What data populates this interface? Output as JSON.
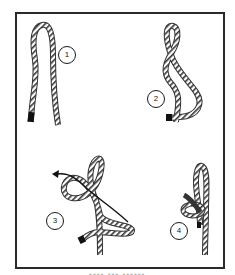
{
  "figure": {
    "caption_visible": false,
    "border_color": "#2a2a2a",
    "rope_color": "#3a3a3a",
    "steps": [
      {
        "number": "1",
        "description": "Rope doubled into a long bight"
      },
      {
        "number": "2",
        "description": "Bight twisted to form a figure-eight style loop"
      },
      {
        "number": "3",
        "description": "Working end passed through loop, arrow shows direction"
      },
      {
        "number": "4",
        "description": "Completed knot with loop"
      }
    ]
  }
}
